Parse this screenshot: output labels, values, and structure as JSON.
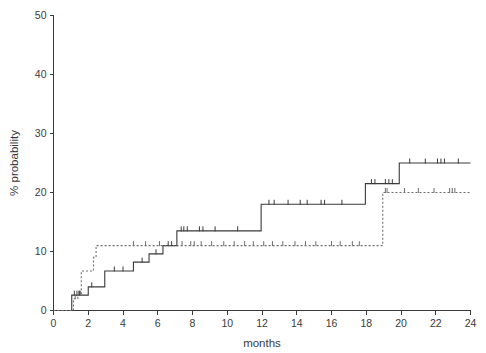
{
  "chart_data": {
    "type": "line",
    "title": "",
    "subtitle": "",
    "xlabel": "months",
    "ylabel": "% probability",
    "xlim": [
      0,
      24
    ],
    "ylim": [
      0,
      50
    ],
    "xticks": [
      0,
      2,
      4,
      6,
      8,
      10,
      12,
      14,
      16,
      18,
      20,
      22,
      24
    ],
    "yticks": [
      0,
      10,
      20,
      30,
      40,
      50
    ],
    "xtick_labels": [
      "0",
      "2",
      "4",
      "6",
      "8",
      "10",
      "12",
      "14",
      "16",
      "18",
      "20",
      "22",
      "24"
    ],
    "ytick_labels": [
      "0",
      "10",
      "20",
      "30",
      "40",
      "50"
    ],
    "grid": false,
    "legend": "none",
    "style": "kaplan-meier-step-cumulative-incidence",
    "series": [
      {
        "name": "solid-curve",
        "line_style": "solid",
        "color": "#3a3a3a",
        "step": "post",
        "points": [
          [
            0,
            0
          ],
          [
            1.05,
            0
          ],
          [
            1.05,
            2.6
          ],
          [
            2.0,
            2.6
          ],
          [
            2.0,
            4.0
          ],
          [
            2.95,
            4.0
          ],
          [
            2.95,
            6.7
          ],
          [
            4.6,
            6.7
          ],
          [
            4.6,
            8.2
          ],
          [
            5.5,
            8.2
          ],
          [
            5.5,
            9.6
          ],
          [
            6.3,
            9.6
          ],
          [
            6.3,
            11.0
          ],
          [
            7.1,
            11.0
          ],
          [
            7.1,
            13.5
          ],
          [
            11.95,
            13.5
          ],
          [
            11.95,
            18.0
          ],
          [
            17.95,
            18.0
          ],
          [
            17.95,
            21.5
          ],
          [
            19.9,
            21.5
          ],
          [
            19.9,
            25.0
          ],
          [
            24,
            25.0
          ]
        ],
        "censor_times": [
          1.2,
          1.35,
          1.5,
          2.2,
          3.5,
          4.0,
          5.1,
          5.9,
          6.6,
          6.8,
          7.35,
          7.5,
          7.7,
          8.4,
          8.6,
          9.3,
          10.6,
          12.4,
          12.7,
          13.5,
          14.2,
          14.6,
          15.4,
          15.6,
          16.6,
          18.3,
          18.5,
          19.1,
          19.3,
          19.5,
          20.5,
          21.4,
          22.1,
          22.3,
          22.5,
          23.3
        ]
      },
      {
        "name": "dashed-curve",
        "line_style": "dashed",
        "color": "#6e6e6e",
        "step": "post",
        "points": [
          [
            0,
            0
          ],
          [
            1.15,
            0
          ],
          [
            1.15,
            2.0
          ],
          [
            1.4,
            2.0
          ],
          [
            1.4,
            2.6
          ],
          [
            1.6,
            2.6
          ],
          [
            1.6,
            6.7
          ],
          [
            2.3,
            6.7
          ],
          [
            2.3,
            9.0
          ],
          [
            2.45,
            9.0
          ],
          [
            2.45,
            11.0
          ],
          [
            18.95,
            11.0
          ],
          [
            18.95,
            20.0
          ],
          [
            24,
            20.0
          ]
        ],
        "censor_times": [
          1.25,
          1.45,
          1.55,
          4.6,
          5.3,
          6.1,
          7.4,
          7.9,
          8.1,
          8.5,
          9.1,
          9.8,
          10.4,
          11.0,
          11.5,
          12.1,
          12.6,
          13.2,
          13.9,
          14.5,
          15.1,
          16.0,
          16.5,
          17.2,
          17.6,
          19.1,
          19.2,
          20.2,
          21.0,
          21.9,
          22.8,
          22.95,
          23.1
        ]
      }
    ]
  },
  "axes": {
    "x_axis_name": "months-axis",
    "y_axis_name": "percent-probability-axis"
  }
}
